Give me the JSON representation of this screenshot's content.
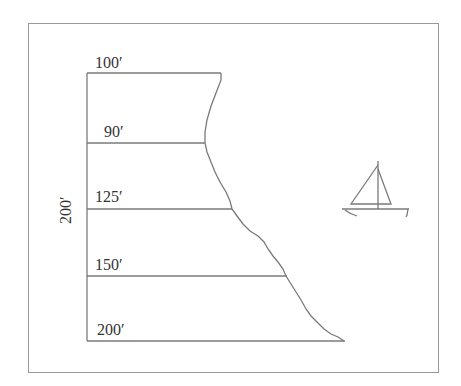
{
  "diagram": {
    "title": "",
    "total_height_label": "200′",
    "lot_lines": [
      {
        "label": "100′",
        "y": 73,
        "x_end": 221
      },
      {
        "label": "90′",
        "y": 143,
        "x_end": 205
      },
      {
        "label": "125′",
        "y": 209,
        "x_end": 232
      },
      {
        "label": "150′",
        "y": 276,
        "x_end": 287
      },
      {
        "label": "200′",
        "y": 341,
        "x_end": 345
      }
    ],
    "elements": [
      "lot-frontages",
      "shoreline",
      "sailboat"
    ]
  }
}
